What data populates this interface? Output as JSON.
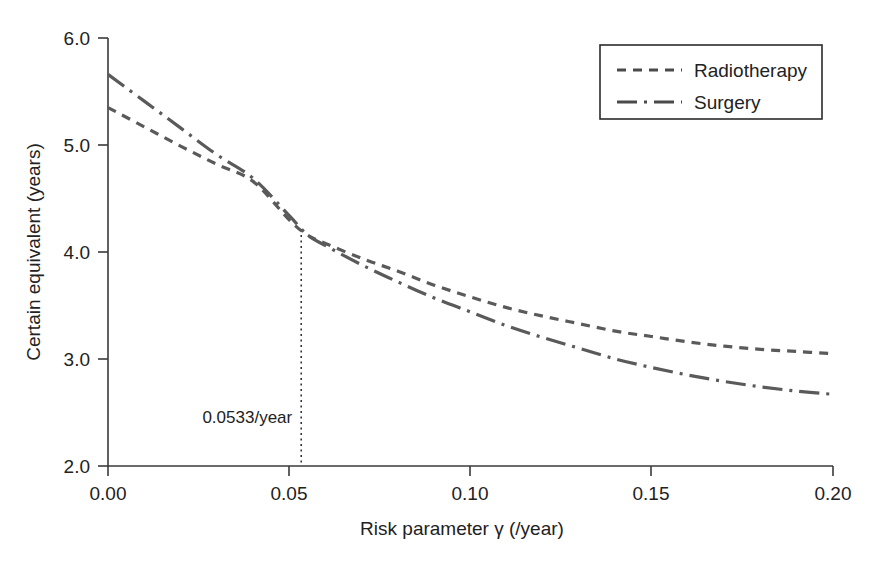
{
  "chart_data": {
    "type": "line",
    "title": "",
    "xlabel": "Risk parameter γ (/year)",
    "ylabel": "Certain equivalent (years)",
    "xlim": [
      0.0,
      0.2
    ],
    "ylim": [
      2.0,
      6.0
    ],
    "xticks": [
      "0.00",
      "0.05",
      "0.10",
      "0.15",
      "0.20"
    ],
    "xtick_values": [
      0.0,
      0.05,
      0.1,
      0.15,
      0.2
    ],
    "yticks": [
      "2.0",
      "3.0",
      "4.0",
      "5.0",
      "6.0"
    ],
    "ytick_values": [
      2.0,
      3.0,
      4.0,
      5.0,
      6.0
    ],
    "grid": false,
    "legend_position": "top-right",
    "x": [
      0.0,
      0.01,
      0.02,
      0.03,
      0.04,
      0.05,
      0.055,
      0.06,
      0.07,
      0.08,
      0.09,
      0.1,
      0.11,
      0.12,
      0.13,
      0.14,
      0.15,
      0.16,
      0.17,
      0.18,
      0.19,
      0.2
    ],
    "series": [
      {
        "name": "Radiotherapy",
        "style": "dashed",
        "values": [
          5.35,
          5.17,
          4.99,
          4.82,
          4.66,
          4.3,
          4.16,
          4.08,
          3.94,
          3.82,
          3.69,
          3.58,
          3.48,
          3.4,
          3.33,
          3.26,
          3.21,
          3.16,
          3.12,
          3.09,
          3.07,
          3.05
        ]
      },
      {
        "name": "Surgery",
        "style": "dash-dot",
        "values": [
          5.66,
          5.41,
          5.16,
          4.91,
          4.69,
          4.34,
          4.16,
          4.06,
          3.88,
          3.72,
          3.57,
          3.44,
          3.31,
          3.2,
          3.1,
          3.0,
          2.92,
          2.85,
          2.79,
          2.74,
          2.7,
          2.67
        ]
      }
    ],
    "annotations": [
      {
        "name": "crossover",
        "label": "0.0533/year",
        "x": 0.0533,
        "y_top": 4.16,
        "y_bottom": 2.0
      }
    ]
  },
  "legend": {
    "entries": [
      {
        "label": "Radiotherapy",
        "style": "dashed"
      },
      {
        "label": "Surgery",
        "style": "dash-dot"
      }
    ]
  },
  "axes": {
    "x_title": "Risk parameter γ (/year)",
    "y_title": "Certain equivalent (years)",
    "x_tick_labels": [
      "0.00",
      "0.05",
      "0.10",
      "0.15",
      "0.20"
    ],
    "y_tick_labels": [
      "2.0",
      "3.0",
      "4.0",
      "5.0",
      "6.0"
    ]
  },
  "colors": {
    "background": "#ffffff",
    "axis": "#3a3a3a",
    "series": "#5a5a5a",
    "text": "#222222"
  }
}
